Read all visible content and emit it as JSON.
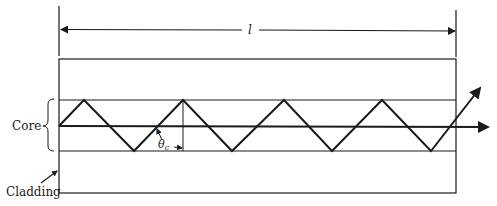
{
  "diagram": {
    "length_label": "l",
    "core_label": "Core",
    "cladding_label": "Cladding",
    "angle_label_symbol": "θ",
    "angle_label_subscript": "c",
    "colors": {
      "line": "#1a1a1a",
      "background": "#ffffff"
    },
    "geometry": {
      "fiber_box": {
        "x1": 59,
        "x2": 456,
        "top": 59,
        "bottom": 193
      },
      "core": {
        "top": 100,
        "bottom": 151,
        "axis": 126
      },
      "dimension_arrow": {
        "y": 30,
        "x1": 61,
        "x2": 455
      },
      "ray_peaks_x": [
        84,
        183,
        284,
        382
      ],
      "ray_valleys_x": [
        134,
        232,
        332,
        431
      ]
    }
  }
}
